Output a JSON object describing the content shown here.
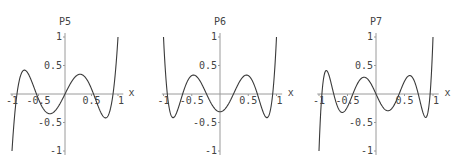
{
  "chart_data": [
    {
      "type": "line",
      "title": "P5",
      "xlabel": "x",
      "ylabel": "P5",
      "function": "Legendre P5(x) = (63x^5 - 70x^3 + 15x)/8",
      "xlim": [
        -1,
        1
      ],
      "ylim": [
        -1,
        1
      ],
      "xticks": [
        "-1",
        "-0.5",
        "0.5",
        "1"
      ],
      "yticks": [
        "1",
        "0.5",
        "-0.5",
        "-1"
      ],
      "coeffs": [
        0,
        1.875,
        0,
        -8.75,
        0,
        7.875
      ],
      "origin_px": [
        65,
        94
      ],
      "scale_px": [
        53,
        57
      ]
    },
    {
      "type": "line",
      "title": "P6",
      "xlabel": "x",
      "ylabel": "P6",
      "function": "Legendre P6(x) = (231x^6 - 315x^4 + 105x^2 - 5)/16",
      "xlim": [
        -1,
        1
      ],
      "ylim": [
        -1,
        1
      ],
      "xticks": [
        "-1",
        "-0.5",
        "0.5",
        "1"
      ],
      "yticks": [
        "1",
        "0.5",
        "-0.5",
        "-1"
      ],
      "coeffs": [
        -0.3125,
        0,
        6.5625,
        0,
        -19.6875,
        0,
        14.4375
      ],
      "origin_px": [
        220,
        94
      ],
      "scale_px": [
        56.5,
        57
      ]
    },
    {
      "type": "line",
      "title": "P7",
      "xlabel": "x",
      "ylabel": "P7",
      "function": "Legendre P7(x) = (429x^7 - 693x^5 + 315x^3 - 35x)/16",
      "xlim": [
        -1,
        1
      ],
      "ylim": [
        -1,
        1
      ],
      "xticks": [
        "-1",
        "-0.5",
        "0.5",
        "1"
      ],
      "yticks": [
        "1",
        "0.5",
        "-0.5",
        "-1"
      ],
      "coeffs": [
        0,
        -2.1875,
        0,
        19.6875,
        0,
        -43.3125,
        0,
        26.8125
      ],
      "origin_px": [
        376,
        94
      ],
      "scale_px": [
        57,
        57
      ]
    }
  ],
  "colors": {
    "curve": "#3a3a3a",
    "axis": "#9a9a9a",
    "text": "#444444"
  }
}
